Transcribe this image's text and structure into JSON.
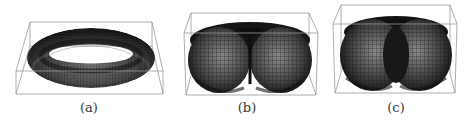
{
  "figure": {
    "panels": [
      {
        "id": "a",
        "label": "(a)",
        "surface": "ring-torus"
      },
      {
        "id": "b",
        "label": "(b)",
        "surface": "horn-torus"
      },
      {
        "id": "c",
        "label": "(c)",
        "surface": "spindle-torus"
      }
    ],
    "colors": {
      "box": "#9a9a9a",
      "surface_dark": "#1a1a1a",
      "surface_mid": "#555555",
      "mesh": "#2b2b2b",
      "caption": "#333333"
    }
  }
}
